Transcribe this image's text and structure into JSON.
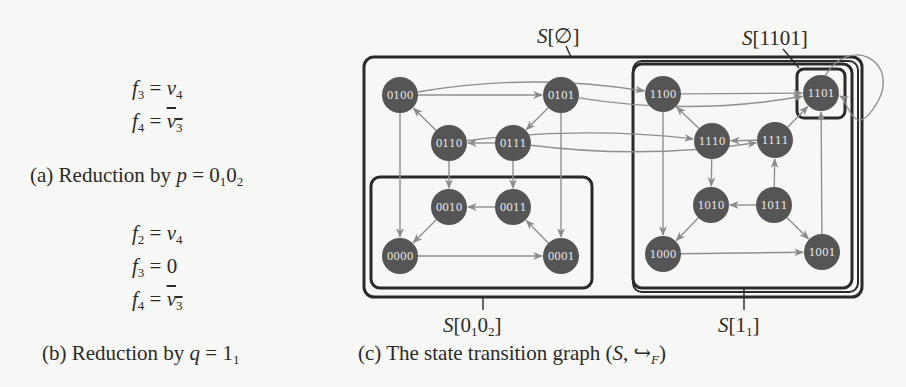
{
  "panel_a": {
    "equations": [
      {
        "lhs": "f",
        "lhs_sub": "3",
        "rhs": "v",
        "rhs_sub": "4",
        "negated": false
      },
      {
        "lhs": "f",
        "lhs_sub": "4",
        "rhs": "v",
        "rhs_sub": "3",
        "negated": true
      }
    ],
    "caption_prefix": "(a) Reduction by ",
    "caption_var": "p",
    "caption_eq": " = 0",
    "caption_sub1": "1",
    "caption_mid": "0",
    "caption_sub2": "2"
  },
  "panel_b": {
    "equations": [
      {
        "lhs": "f",
        "lhs_sub": "2",
        "rhs": "v",
        "rhs_sub": "4",
        "negated": false
      },
      {
        "lhs": "f",
        "lhs_sub": "3",
        "rhs": "0",
        "rhs_sub": "",
        "negated": false
      },
      {
        "lhs": "f",
        "lhs_sub": "4",
        "rhs": "v",
        "rhs_sub": "3",
        "negated": true
      }
    ],
    "caption_prefix": "(b) Reduction by ",
    "caption_var": "q",
    "caption_eq": " = 1",
    "caption_sub1": "1"
  },
  "panel_c": {
    "caption_prefix": "(c) The state transition graph (",
    "caption_var": "S",
    "caption_arrow": ", ↪",
    "caption_sub": "F",
    "caption_suffix": ")",
    "subsets": [
      {
        "id": "S_empty",
        "label_main": "S",
        "label_arg": "[∅]",
        "label_sub": ""
      },
      {
        "id": "S_1101",
        "label_main": "S",
        "label_arg": "[1101]",
        "label_sub": ""
      },
      {
        "id": "S_0102",
        "label_main": "S",
        "label_arg": "[0",
        "label_sub": "1",
        "label_arg2": "0",
        "label_sub2": "2",
        "label_close": "]"
      },
      {
        "id": "S_11",
        "label_main": "S",
        "label_arg": "[1",
        "label_sub": "1",
        "label_close": "]"
      }
    ],
    "nodes": [
      {
        "id": "0100",
        "x": 400,
        "y": 95
      },
      {
        "id": "0101",
        "x": 561,
        "y": 95
      },
      {
        "id": "0110",
        "x": 449,
        "y": 143
      },
      {
        "id": "0111",
        "x": 513,
        "y": 143
      },
      {
        "id": "0010",
        "x": 449,
        "y": 207
      },
      {
        "id": "0011",
        "x": 513,
        "y": 207
      },
      {
        "id": "0000",
        "x": 400,
        "y": 256
      },
      {
        "id": "0001",
        "x": 561,
        "y": 256
      },
      {
        "id": "1100",
        "x": 663,
        "y": 94
      },
      {
        "id": "1101",
        "x": 821,
        "y": 93
      },
      {
        "id": "1110",
        "x": 712,
        "y": 141
      },
      {
        "id": "1111",
        "x": 775,
        "y": 140
      },
      {
        "id": "1010",
        "x": 711,
        "y": 205
      },
      {
        "id": "1011",
        "x": 774,
        "y": 205
      },
      {
        "id": "1000",
        "x": 663,
        "y": 254
      },
      {
        "id": "1001",
        "x": 822,
        "y": 252
      }
    ],
    "edges": [
      {
        "from": "0100",
        "to": "0101"
      },
      {
        "from": "0101",
        "to": "0111"
      },
      {
        "from": "0111",
        "to": "0110"
      },
      {
        "from": "0110",
        "to": "0100"
      },
      {
        "from": "0100",
        "to": "0000"
      },
      {
        "from": "0110",
        "to": "0010"
      },
      {
        "from": "0111",
        "to": "0011"
      },
      {
        "from": "0101",
        "to": "0001"
      },
      {
        "from": "0011",
        "to": "0010"
      },
      {
        "from": "0010",
        "to": "0000"
      },
      {
        "from": "0000",
        "to": "0001"
      },
      {
        "from": "0001",
        "to": "0011"
      },
      {
        "from": "1100",
        "to": "1101"
      },
      {
        "from": "1110",
        "to": "1100"
      },
      {
        "from": "1111",
        "to": "1110"
      },
      {
        "from": "1111",
        "to": "1101"
      },
      {
        "from": "1100",
        "to": "1000"
      },
      {
        "from": "1110",
        "to": "1010"
      },
      {
        "from": "1011",
        "to": "1111"
      },
      {
        "from": "1001",
        "to": "1101"
      },
      {
        "from": "1011",
        "to": "1010"
      },
      {
        "from": "1010",
        "to": "1000"
      },
      {
        "from": "1000",
        "to": "1001"
      },
      {
        "from": "1011",
        "to": "1001"
      },
      {
        "from": "0100",
        "to": "1100",
        "curve": -22
      },
      {
        "from": "0101",
        "to": "1101",
        "curve": 22
      },
      {
        "from": "0110",
        "to": "1110",
        "curve": -16
      },
      {
        "from": "0111",
        "to": "1111",
        "curve": 18
      },
      {
        "from": "1101",
        "to": "1101",
        "self": true
      }
    ]
  }
}
